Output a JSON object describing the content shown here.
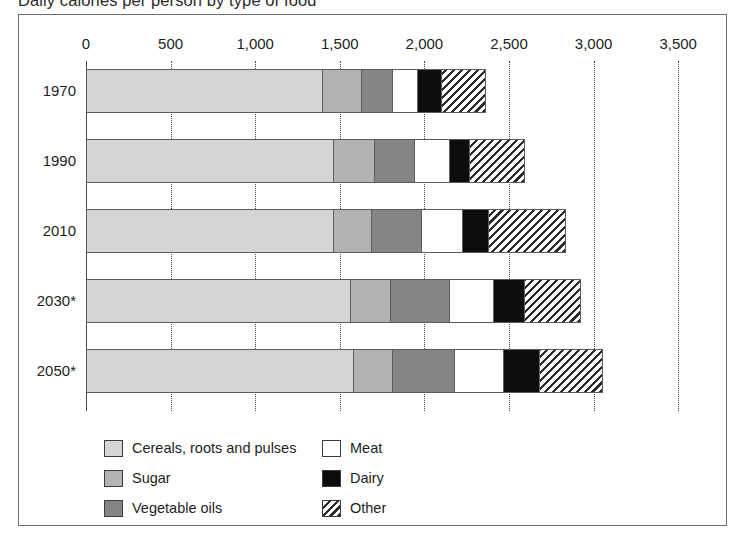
{
  "chart_data": {
    "type": "bar",
    "subtype": "stacked-horizontal",
    "title": "Daily calories per person by type of food",
    "xlabel": "",
    "ylabel": "",
    "orientation": "horizontal",
    "stacked": true,
    "grid": true,
    "legend_position": "bottom-left",
    "xlim": [
      0,
      3500
    ],
    "xticks": [
      0,
      500,
      1000,
      1500,
      2000,
      2500,
      3000,
      3500
    ],
    "xtick_labels": [
      "0",
      "500",
      "1,000",
      "1,500",
      "2,000",
      "2,500",
      "3,000",
      "3,500"
    ],
    "categories": [
      "1970",
      "1990",
      "2010",
      "2030*",
      "2050*"
    ],
    "series": [
      {
        "name": "Cereals, roots and pulses",
        "color": "#d5d5d3",
        "values": [
          1400,
          1465,
          1465,
          1565,
          1583
        ]
      },
      {
        "name": "Sugar",
        "color": "#b3b3b1",
        "values": [
          236,
          242,
          225,
          236,
          230
        ]
      },
      {
        "name": "Vegetable oils",
        "color": "#858585",
        "values": [
          183,
          242,
          301,
          355,
          372
        ]
      },
      {
        "name": "Meat",
        "color": "#ffffff",
        "values": [
          148,
          207,
          242,
          260,
          290
        ]
      },
      {
        "name": "Dairy",
        "color": "#0d0d0d",
        "values": [
          142,
          118,
          154,
          183,
          213
        ]
      },
      {
        "name": "Other",
        "color": "hatch",
        "values": [
          255,
          320,
          450,
          326,
          367
        ]
      }
    ],
    "totals": [
      2364,
      2594,
      2837,
      2925,
      3055
    ],
    "footnote_marker": "*"
  },
  "legend": {
    "items": [
      {
        "label": "Cereals, roots and pulses",
        "swatch": "cereals"
      },
      {
        "label": "Sugar",
        "swatch": "sugar"
      },
      {
        "label": "Vegetable oils",
        "swatch": "vegoils"
      },
      {
        "label": "Meat",
        "swatch": "meat"
      },
      {
        "label": "Dairy",
        "swatch": "dairy"
      },
      {
        "label": "Other",
        "swatch": "other"
      }
    ]
  }
}
